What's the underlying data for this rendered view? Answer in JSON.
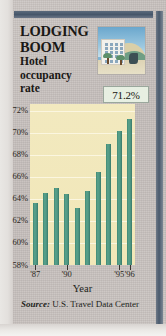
{
  "header": {
    "title_line1": "LODGING",
    "title_line2": "BOOM",
    "subtitle_line1": "Hotel",
    "subtitle_line2": "occupancy",
    "subtitle_line3": "rate"
  },
  "callout": {
    "value": "71.2%"
  },
  "illustration": {
    "name": "hotel-resort-illustration",
    "sky_color": "#7fb4d4",
    "building_color": "#f2f1ec",
    "hill_color": "#6f9e85"
  },
  "source": {
    "label": "Source:",
    "text_line1": "U.S. Travel",
    "text_line2": "Data Center"
  },
  "colors": {
    "bar": "#4d9480",
    "plot_background": "#f1e7b8",
    "paper": "#c9c3c0",
    "rule": "#46566a",
    "callout_background": "#e7efe2"
  },
  "chart_data": {
    "type": "bar",
    "xlabel": "Year",
    "ylabel": "",
    "ylim": [
      58,
      72.6
    ],
    "grid": true,
    "legend": false,
    "categories": [
      "'87",
      "'88",
      "'89",
      "'90",
      "'91",
      "'92",
      "'93",
      "'94",
      "'95",
      "'96"
    ],
    "values": [
      63.6,
      64.5,
      65.0,
      64.4,
      63.2,
      64.7,
      66.4,
      69.0,
      70.2,
      71.2
    ],
    "ytick_labels": [
      "72%",
      "70%",
      "68%",
      "66%",
      "64%",
      "62%",
      "60%",
      "58%"
    ],
    "ytick_values": [
      72,
      70,
      68,
      66,
      64,
      62,
      60,
      58
    ],
    "xtick_labels": [
      "'87",
      "'90",
      "'95",
      "'96"
    ],
    "xtick_indices": [
      0,
      3,
      8,
      9
    ],
    "annotations": [
      {
        "text": "71.2%",
        "target_category": "'96"
      }
    ]
  }
}
